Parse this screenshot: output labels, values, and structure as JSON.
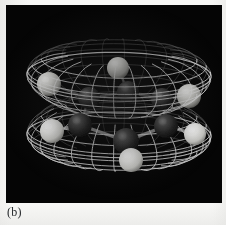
{
  "figure": {
    "caption": "(b)",
    "panel_background": "#050505",
    "page_background": "#f7f7f5",
    "render_style": "wireframe-mesh",
    "mesh_color": "#d8d8d8",
    "panel": {
      "x": 6,
      "y": 5,
      "width": 216,
      "height": 198
    }
  },
  "scene": {
    "isosurface": {
      "name": "pi-orbital-isosurface",
      "shape": "double-lobed-torus",
      "lobes": 2,
      "description": "upper and lower lobe above and below the ring plane",
      "wire_color": "#dcdcdc",
      "mesh_u_lines": 26,
      "mesh_v_lines": 14,
      "center_x": 113,
      "center_y": 100,
      "radius_x": 92,
      "lobe_height": 52,
      "waist_y": 100
    },
    "atoms": [
      {
        "name": "carbon-front",
        "element": "C",
        "color": "#2a2a2a",
        "highlight": "#6e6e6e",
        "cx": 120,
        "cy": 136,
        "r": 13,
        "z": 9
      },
      {
        "name": "carbon-front-left",
        "element": "C",
        "color": "#303030",
        "highlight": "#7a7a7a",
        "cx": 74,
        "cy": 120,
        "r": 12,
        "z": 8
      },
      {
        "name": "carbon-front-right",
        "element": "C",
        "color": "#2e2e2e",
        "highlight": "#787878",
        "cx": 160,
        "cy": 121,
        "r": 12,
        "z": 8
      },
      {
        "name": "carbon-back-left",
        "element": "C",
        "color": "#262626",
        "highlight": "#6a6a6a",
        "cx": 83,
        "cy": 93,
        "r": 11,
        "z": 4
      },
      {
        "name": "carbon-back",
        "element": "C",
        "color": "#242424",
        "highlight": "#686868",
        "cx": 122,
        "cy": 87,
        "r": 11,
        "z": 3
      },
      {
        "name": "carbon-back-right",
        "element": "C",
        "color": "#282828",
        "highlight": "#707070",
        "cx": 156,
        "cy": 94,
        "r": 11,
        "z": 4
      },
      {
        "name": "hydrogen-bottom",
        "element": "H",
        "color": "#f2f2f0",
        "highlight": "#ffffff",
        "cx": 125,
        "cy": 155,
        "r": 12,
        "z": 10
      },
      {
        "name": "hydrogen-left",
        "element": "H",
        "color": "#efefed",
        "highlight": "#ffffff",
        "cx": 46,
        "cy": 126,
        "r": 12,
        "z": 9
      },
      {
        "name": "hydrogen-right",
        "element": "H",
        "color": "#e9e9e7",
        "highlight": "#ffffff",
        "cx": 189,
        "cy": 129,
        "r": 11,
        "z": 9
      },
      {
        "name": "hydrogen-top-left",
        "element": "H",
        "color": "#d2d2cf",
        "highlight": "#f6f6f4",
        "cx": 43,
        "cy": 79,
        "r": 12,
        "z": 2
      },
      {
        "name": "hydrogen-top",
        "element": "H",
        "color": "#cbcbc8",
        "highlight": "#f0f0ee",
        "cx": 112,
        "cy": 63,
        "r": 11,
        "z": 1
      },
      {
        "name": "hydrogen-top-right",
        "element": "H",
        "color": "#cfcfcc",
        "highlight": "#f2f2f0",
        "cx": 183,
        "cy": 91,
        "r": 12,
        "z": 2
      }
    ],
    "bonds": [
      {
        "name": "bond-ring-1",
        "from": "carbon-front",
        "to": "carbon-front-left",
        "color": "#9a9a9a"
      },
      {
        "name": "bond-ring-2",
        "from": "carbon-front",
        "to": "carbon-front-right",
        "color": "#9a9a9a"
      },
      {
        "name": "bond-ring-3",
        "from": "carbon-front-left",
        "to": "carbon-back-left",
        "color": "#8c8c8c"
      },
      {
        "name": "bond-ring-4",
        "from": "carbon-front-right",
        "to": "carbon-back-right",
        "color": "#8c8c8c"
      },
      {
        "name": "bond-ring-5",
        "from": "carbon-back-left",
        "to": "carbon-back",
        "color": "#7e7e7e"
      },
      {
        "name": "bond-ring-6",
        "from": "carbon-back",
        "to": "carbon-back-right",
        "color": "#7e7e7e"
      },
      {
        "name": "bond-ch-1",
        "from": "carbon-front",
        "to": "hydrogen-bottom",
        "color": "#a8a8a8"
      },
      {
        "name": "bond-ch-2",
        "from": "carbon-front-left",
        "to": "hydrogen-left",
        "color": "#a8a8a8"
      },
      {
        "name": "bond-ch-3",
        "from": "carbon-front-right",
        "to": "hydrogen-right",
        "color": "#a0a0a0"
      },
      {
        "name": "bond-ch-4",
        "from": "carbon-back-left",
        "to": "hydrogen-top-left",
        "color": "#8a8a8a"
      },
      {
        "name": "bond-ch-5",
        "from": "carbon-back",
        "to": "hydrogen-top",
        "color": "#848484"
      },
      {
        "name": "bond-ch-6",
        "from": "carbon-back-right",
        "to": "hydrogen-top-right",
        "color": "#8a8a8a"
      }
    ]
  }
}
